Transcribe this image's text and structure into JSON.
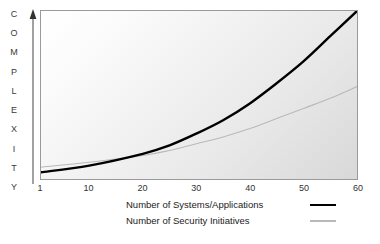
{
  "chart_data": {
    "type": "line",
    "title": "",
    "subtitle": "",
    "xlabel": "",
    "ylabel": "COMPLEXITY",
    "ylabel_letters": [
      "C",
      "O",
      "M",
      "P",
      "L",
      "E",
      "X",
      "I",
      "T",
      "Y"
    ],
    "xticks": [
      1,
      10,
      20,
      30,
      40,
      50,
      60
    ],
    "xtick_labels": [
      "1",
      "10",
      "20",
      "30",
      "40",
      "50",
      "60"
    ],
    "xlim": [
      1,
      60
    ],
    "ylim": [
      0,
      100
    ],
    "yticks": [],
    "ytick_labels": [],
    "grid": false,
    "legend_position": "below-right",
    "axis_arrow": "up",
    "series": [
      {
        "name": "Number of Systems/Applications",
        "color": "#000000",
        "width": 2.4,
        "x": [
          1,
          10,
          20,
          25,
          30,
          35,
          40,
          45,
          50,
          55,
          60
        ],
        "values": [
          4,
          8,
          15,
          20,
          27,
          35,
          45,
          57,
          70,
          85,
          100
        ]
      },
      {
        "name": "Number of Security Initiatives",
        "color": "#b9b9b9",
        "width": 1.1,
        "x": [
          1,
          10,
          20,
          25,
          30,
          35,
          40,
          45,
          50,
          55,
          60
        ],
        "values": [
          7,
          10,
          14,
          17,
          21,
          25,
          30,
          36,
          42,
          48,
          55
        ]
      }
    ]
  },
  "legend": {
    "items": [
      {
        "label": "Number of Systems/Applications",
        "color": "#000000"
      },
      {
        "label": "Number of Security Initiatives",
        "color": "#b9b9b9"
      }
    ]
  },
  "colors": {
    "systems_line": "#000000",
    "security_line": "#b9b9b9",
    "frame": "#9a9a9a",
    "axis": "#8a8a8a",
    "text": "#333333"
  }
}
